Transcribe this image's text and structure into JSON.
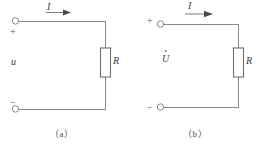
{
  "figure": {
    "type": "electrical-circuit-diagram",
    "line_color": "#8a8a8a",
    "text_color": "#3d3d3d",
    "background": "#ffffff"
  },
  "circuit_a": {
    "caption": "（a）",
    "current_label": "I",
    "voltage_label": "u",
    "resistor_label": "R",
    "positive_terminal_sign": "+",
    "negative_terminal_sign": "−",
    "terminal_top_name": "top-terminal",
    "terminal_bottom_name": "bottom-terminal"
  },
  "circuit_b": {
    "caption": "（b）",
    "current_label": "I",
    "current_label_has_overdot": true,
    "voltage_label": "U",
    "voltage_label_has_overdot": true,
    "resistor_label": "R",
    "positive_terminal_sign": "+",
    "negative_terminal_sign": "−",
    "terminal_top_name": "top-terminal",
    "terminal_bottom_name": "bottom-terminal"
  }
}
